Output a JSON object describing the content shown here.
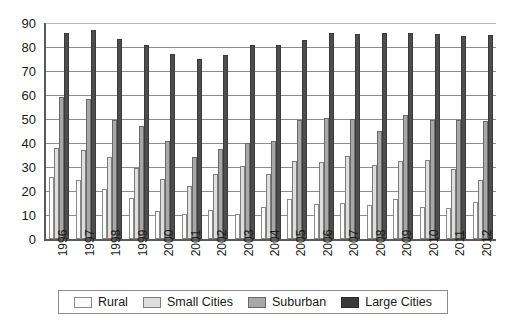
{
  "chart_data": {
    "type": "bar",
    "title": "",
    "xlabel": "",
    "ylabel": "",
    "ylim": [
      0,
      90
    ],
    "ytick_step": 10,
    "yticks": [
      90,
      80,
      70,
      60,
      50,
      40,
      30,
      20,
      10,
      0
    ],
    "grid": true,
    "legend_position": "bottom",
    "categories": [
      "1996",
      "1997",
      "1998",
      "1999",
      "2000",
      "2001",
      "2002",
      "2003",
      "2004",
      "2005",
      "2006",
      "2007",
      "2008",
      "2009",
      "2010",
      "2011",
      "2012"
    ],
    "series": [
      {
        "name": "Rural",
        "color": "#FBFBFA",
        "values": [
          26,
          24.5,
          21,
          17,
          11.5,
          10.5,
          12,
          10.5,
          13.5,
          16.5,
          14.5,
          15,
          14,
          16.5,
          13.5,
          13,
          15.5
        ]
      },
      {
        "name": "Small Cities",
        "color": "#DEDEDE",
        "values": [
          38,
          37,
          34,
          29.5,
          25,
          22,
          27,
          30.5,
          27,
          32.5,
          32,
          34.5,
          31,
          32.5,
          33,
          29,
          24.5
        ]
      },
      {
        "name": "Suburban",
        "color": "#A8A8A8",
        "values": [
          59,
          58.5,
          49.5,
          47,
          41,
          34,
          37.5,
          40,
          41,
          49.5,
          50.5,
          50,
          45,
          51.5,
          49.5,
          49.5,
          49
        ]
      },
      {
        "name": "Large Cities",
        "color": "#4D4D4D",
        "values": [
          86,
          87,
          83.5,
          81,
          77,
          75,
          76.5,
          81,
          81,
          83,
          86,
          85.5,
          86,
          86,
          85.5,
          84.5,
          85
        ]
      }
    ]
  },
  "legend": {
    "items": [
      {
        "label": "Rural",
        "swatch": "rural"
      },
      {
        "label": "Small Cities",
        "swatch": "small"
      },
      {
        "label": "Suburban",
        "swatch": "suburban"
      },
      {
        "label": "Large Cities",
        "swatch": "large"
      }
    ]
  }
}
